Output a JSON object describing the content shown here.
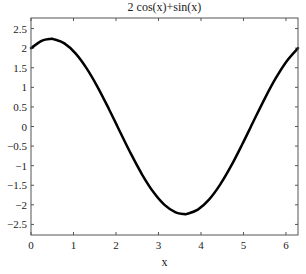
{
  "chart_data": {
    "type": "line",
    "title": "2 cos(x)+sin(x)",
    "xlabel": "x",
    "ylabel": "",
    "xlim": [
      0,
      6.2832
    ],
    "ylim": [
      -2.77,
      2.77
    ],
    "xticks": [
      0,
      1,
      2,
      3,
      4,
      5,
      6
    ],
    "xtick_labels": [
      "0",
      "1",
      "2",
      "3",
      "4",
      "5",
      "6"
    ],
    "yticks": [
      -2.5,
      -2,
      -1.5,
      -1,
      -0.5,
      0,
      0.5,
      1,
      1.5,
      2,
      2.5
    ],
    "ytick_labels": [
      "−2.5",
      "−2",
      "−1.5",
      "−1",
      "−0.5",
      "0",
      "0.5",
      "1",
      "1.5",
      "2",
      "2.5"
    ],
    "grid": false,
    "legend": null,
    "series": [
      {
        "name": "2 cos(x)+sin(x)",
        "color": "#000000",
        "linewidth": 2.5,
        "x": [
          0,
          0.2618,
          0.4636,
          0.5236,
          0.7854,
          1.0472,
          1.309,
          1.5708,
          1.8326,
          2.0344,
          2.0944,
          2.3562,
          2.618,
          2.8798,
          3.1416,
          3.4034,
          3.6052,
          3.6652,
          3.927,
          4.1888,
          4.4506,
          4.7124,
          4.9742,
          5.176,
          5.236,
          5.4978,
          5.7596,
          6.0214,
          6.2832
        ],
        "y": [
          2.0,
          2.191,
          2.236,
          2.232,
          2.121,
          1.866,
          1.483,
          1.0,
          0.448,
          0.0,
          -0.134,
          -0.707,
          -1.232,
          -1.673,
          -2.0,
          -2.191,
          -2.236,
          -2.232,
          -2.121,
          -1.866,
          -1.483,
          -1.0,
          -0.448,
          0.0,
          0.134,
          0.707,
          1.232,
          1.673,
          2.0
        ]
      }
    ]
  },
  "labels": {
    "title": "2 cos(x)+sin(x)",
    "xlabel": "x"
  },
  "style": {
    "frame_color": "#555555",
    "line_color": "#000000",
    "text_color": "#222222",
    "background": "#ffffff"
  }
}
